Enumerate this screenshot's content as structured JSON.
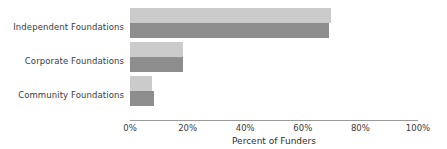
{
  "chart_data": {
    "type": "bar",
    "orientation": "horizontal",
    "title": "",
    "xlabel": "Percent of Funders",
    "ylabel": "",
    "categories": [
      "Independent Foundations",
      "Corporate Foundations",
      "Community Foundations"
    ],
    "series": [
      {
        "name": "series-1",
        "color": "#cbcbcb",
        "values": [
          70,
          18.5,
          7.5
        ]
      },
      {
        "name": "series-2",
        "color": "#8d8d8d",
        "values": [
          69.5,
          18.5,
          8.5
        ]
      }
    ],
    "xlim": [
      0,
      100
    ],
    "xticks": [
      0,
      20,
      40,
      60,
      80,
      100
    ],
    "xtick_labels": [
      "0%",
      "20%",
      "40%",
      "60%",
      "80%",
      "100%"
    ],
    "grid": false,
    "legend": "none",
    "axis_color": "#9a9a9a",
    "text_color": "#3b3b3b",
    "background": "#ffffff"
  }
}
